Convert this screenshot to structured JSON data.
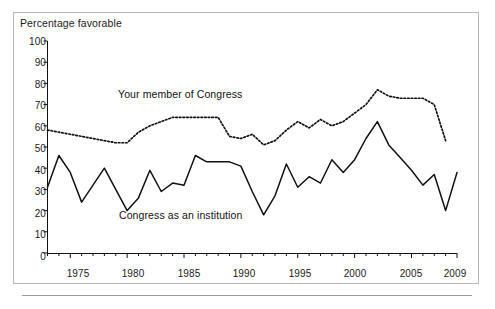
{
  "figure": {
    "axis_title": "Percentage favorable",
    "y_ticks": [
      "100",
      "90",
      "80",
      "70",
      "60",
      "50",
      "40",
      "30",
      "20",
      "10",
      "0"
    ],
    "x_ticks": [
      "1975",
      "1980",
      "1985",
      "1990",
      "1995",
      "2000",
      "2005",
      "2009"
    ],
    "series_labels": {
      "member": "Your member of Congress",
      "institution": "Congress as an institution"
    },
    "colors": {
      "line": "#111111",
      "frame": "#b9b9b9",
      "text": "#1b1b1b",
      "background": "#ffffff"
    }
  },
  "chart_data": {
    "type": "line",
    "title": "",
    "xlabel": "",
    "ylabel": "Percentage favorable",
    "xlim": [
      1973,
      2009
    ],
    "ylim": [
      0,
      100
    ],
    "grid": false,
    "legend": "inline-annotations",
    "x": [
      1973,
      1974,
      1975,
      1976,
      1977,
      1978,
      1979,
      1980,
      1981,
      1982,
      1983,
      1984,
      1985,
      1986,
      1987,
      1988,
      1989,
      1990,
      1991,
      1992,
      1993,
      1994,
      1995,
      1996,
      1997,
      1998,
      1999,
      2000,
      2001,
      2002,
      2003,
      2004,
      2005,
      2006,
      2007,
      2008,
      2009
    ],
    "series": [
      {
        "name": "Your member of Congress",
        "style": "dotted",
        "values": [
          58,
          57,
          56,
          55,
          54,
          53,
          52,
          52,
          57,
          60,
          62,
          64,
          64,
          64,
          64,
          64,
          55,
          54,
          56,
          51,
          53,
          58,
          62,
          59,
          63,
          60,
          62,
          66,
          70,
          77,
          74,
          73,
          73,
          73,
          70,
          53,
          null
        ]
      },
      {
        "name": "Congress as an institution",
        "style": "solid",
        "values": [
          31,
          46,
          38,
          24,
          32,
          40,
          30,
          20,
          26,
          39,
          29,
          33,
          32,
          46,
          43,
          43,
          43,
          41,
          29,
          18,
          27,
          42,
          31,
          36,
          33,
          44,
          38,
          44,
          54,
          62,
          51,
          45,
          39,
          32,
          37,
          20,
          38
        ]
      }
    ]
  }
}
